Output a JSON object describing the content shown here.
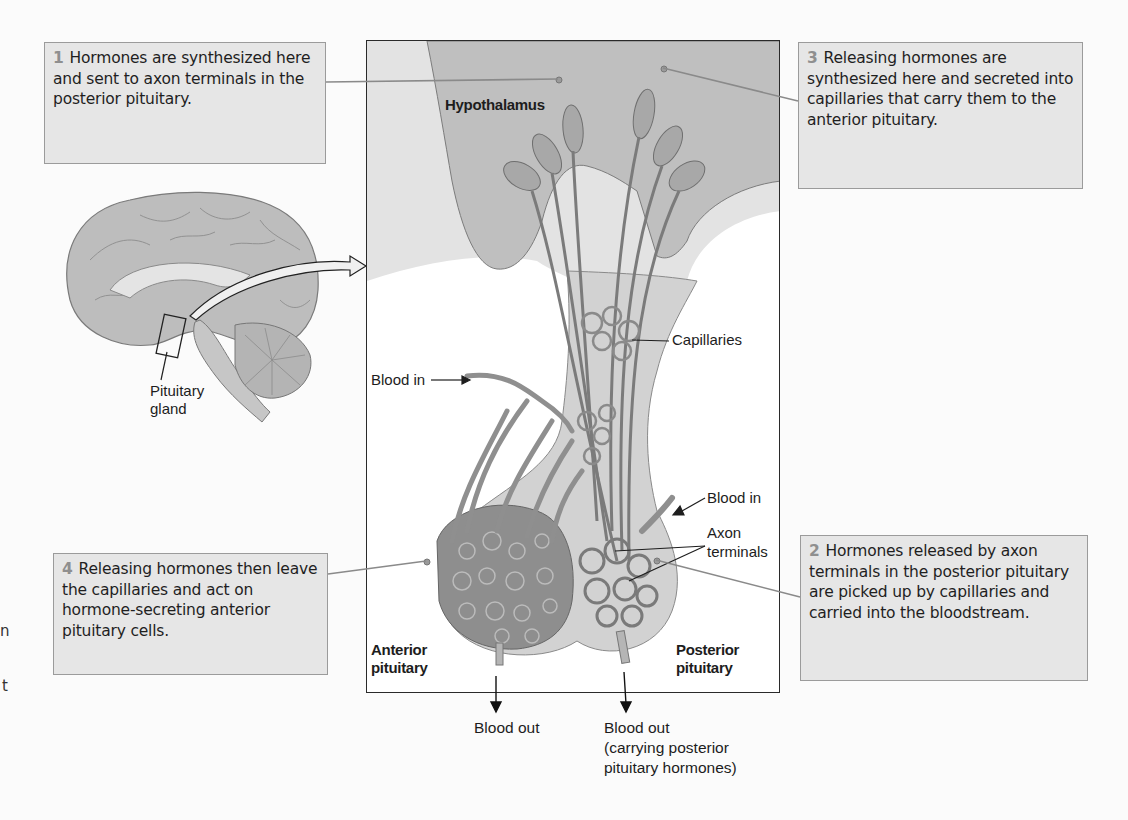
{
  "figure": {
    "callouts": [
      {
        "number": "1",
        "text": "Hormones are synthesized here and sent to axon terminals in the posterior pituitary."
      },
      {
        "number": "2",
        "text": "Hormones released by axon terminals in the posterior pituitary are picked up by capillaries and carried into the bloodstream."
      },
      {
        "number": "3",
        "text": "Releasing hormones are synthesized here and secreted into capillaries that carry them to the anterior pituitary."
      },
      {
        "number": "4",
        "text": "Releasing hormones then leave the capillaries and act on hormone-secreting anterior pituitary cells."
      }
    ],
    "labels": {
      "hypothalamus": "Hypothalamus",
      "capillaries": "Capillaries",
      "blood_in_left": "Blood in",
      "blood_in_right": "Blood in",
      "axon_line1": "Axon",
      "axon_line2": "terminals",
      "anterior_line1": "Anterior",
      "anterior_line2": "pituitary",
      "posterior_line1": "Posterior",
      "posterior_line2": "pituitary",
      "pituitary_gland_line1": "Pituitary",
      "pituitary_gland_line2": "gland",
      "blood_out_left": "Blood out",
      "blood_out_right_line1": "Blood out",
      "blood_out_right_line2": "(carrying posterior",
      "blood_out_right_line3": "pituitary hormones)"
    },
    "edge_fragments": [
      "n",
      "t"
    ],
    "colors": {
      "callout_bg": "#e6e6e6",
      "callout_border": "#9b9b9b",
      "number_gray": "#8f8f8f",
      "tissue_dark": "#b8b8b8",
      "tissue_light": "#dcdcdc",
      "vessel": "#8a8a8a"
    }
  }
}
